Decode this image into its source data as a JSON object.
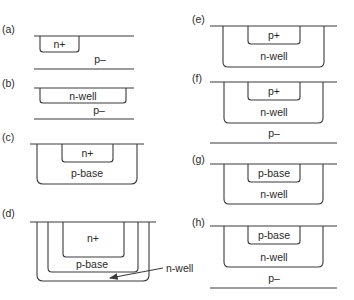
{
  "panels": {
    "a": {
      "label": "(a)",
      "regions": [
        "n+"
      ],
      "substrate": "p–"
    },
    "b": {
      "label": "(b)",
      "regions": [
        "n-well"
      ],
      "substrate": "p–"
    },
    "c": {
      "label": "(c)",
      "regions": [
        "n+",
        "p-base"
      ]
    },
    "d": {
      "label": "(d)",
      "regions": [
        "n+",
        "p-base"
      ],
      "annotation": "n-well"
    },
    "e": {
      "label": "(e)",
      "regions": [
        "p+",
        "n-well"
      ]
    },
    "f": {
      "label": "(f)",
      "regions": [
        "p+",
        "n-well"
      ],
      "substrate": "p–"
    },
    "g": {
      "label": "(g)",
      "regions": [
        "p-base",
        "n-well"
      ]
    },
    "h": {
      "label": "(h)",
      "regions": [
        "p-base",
        "n-well"
      ],
      "substrate": "p–"
    }
  },
  "colors": {
    "line": "#3a3a3a",
    "text": "#2a2a2a",
    "background": "#ffffff"
  }
}
